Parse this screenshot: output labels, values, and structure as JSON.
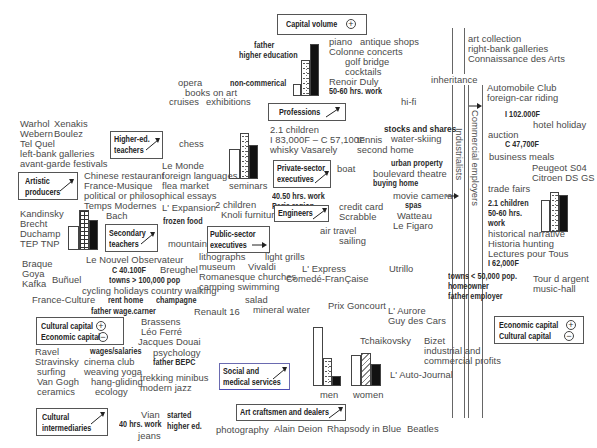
{
  "boxes": {
    "capital_volume": {
      "label": "Capital volume",
      "sign": "+"
    },
    "professions": {
      "label": "Professions"
    },
    "higher_ed_teachers": {
      "line1": "Higher-ed.",
      "line2": "teachers"
    },
    "artistic_producers": {
      "line1": "Artistic",
      "line2": "producers"
    },
    "private_sector": {
      "line1": "Private-sector",
      "line2": "executives"
    },
    "engineers": {
      "label": "Engineers"
    },
    "secondary_teachers": {
      "line1": "Secondary",
      "line2": "teachers"
    },
    "public_sector": {
      "line1": "Public-sector",
      "line2": "executives"
    },
    "cultural_capital_legend": {
      "line1": "Cultural capital",
      "line2": "Economic capital",
      "sign1": "+",
      "sign2": "−"
    },
    "economic_capital_legend": {
      "line1": "Economic capital",
      "line2": "Cultural capital",
      "sign1": "+",
      "sign2": "−"
    },
    "social_medical": {
      "line1": "Social and",
      "line2": "medical services"
    },
    "cultural_intermediaries": {
      "line1": "Cultural",
      "line2": "intermediaries"
    },
    "art_craftsmen": {
      "label": "Art craftsmen and dealers"
    }
  },
  "vertical_labels": {
    "industrialists": "Industrialists",
    "commercial_employers": "Commercial employers"
  },
  "texts": {
    "father_he_1": "father",
    "father_he_2": "higher education",
    "piano": "piano",
    "antique": "antique shops",
    "colonne": "Colonne concerts",
    "golf": "golf  bridge",
    "cocktails": "cocktails",
    "renoir": "Renoir  Duly",
    "hrs5060a": "50-60 hrs. work",
    "art_collection": "art collection",
    "rightbank": "right-bank galleries",
    "connaissance": "Connaissance des Arts",
    "inheritance": "inheritance",
    "opera": "opera",
    "books_art": "books on art",
    "cruises": "cruises",
    "exhibitions": "exhibitions",
    "noncommercial": "non-commerical",
    "hifi": "hi-fi",
    "automobile": "Automobile Club",
    "foreigncar": "foreign-car riding",
    "i102": "I 102.000F",
    "hotel": "hotel holiday",
    "auction": "auction",
    "c47": "C 47,700F",
    "business": "business meals",
    "peugeot": "Peugeot S04",
    "citroen": "Citroen DS GS",
    "trade": "trade fairs",
    "children21b": "2.1 children",
    "hrs5060b": "50-60 hrs.",
    "work_b": "work",
    "historical": "historical narrative",
    "historia": "Historia hunting",
    "lectures": "Lectures pour Tous",
    "i62": "I 62,000F",
    "towns50": "towns < 50,000 pop.",
    "homeowner": "homeowner",
    "father_employer": "father employer",
    "tour": "Tour d argent",
    "musichall": "music-hall",
    "warhol": "Warhol",
    "xenakis": "Xenakis",
    "webern": "Webern",
    "boulez": "Boulez",
    "telquel": "Tel Quel",
    "leftbank": "left-bank galleries",
    "avantgarde": "avant-garde festivals",
    "chess": "chess",
    "children21a": "2.1 children",
    "i83": "I 83,000F – C 57,100F",
    "whisky": "whisky    Vasarely",
    "stocks": "stocks and shares",
    "tennis": "tennis",
    "waterski": "water-skiing",
    "secondhome": "second home",
    "lemonde": "Le Monde",
    "foreignlang": "foreign languages",
    "flea": "flea market",
    "seminars": "seminars",
    "boat": "boat",
    "urban": "urban property",
    "boulevard": "boulevard theatre",
    "buying": "buying home",
    "chinese": "Chinese restaurant",
    "francemusique": "France-Musique",
    "political": "political or philosophical essays",
    "tempsmodernes": "Temps Modernes",
    "hrs4050": "40.50 hrs. work",
    "paris": "Paris region",
    "movie": "movie camera",
    "spas": "spas",
    "watteau": "Watteau",
    "lexpansion": "L' Expansion",
    "children2": "2 children",
    "knoli": "Knoli furniture",
    "creditcard": "credit card",
    "scrabble": "Scrabble",
    "figaro": "Le Figaro",
    "kandinsky": "Kandinsky",
    "brecht": "Brecht",
    "duchamp": "Duchamp",
    "tep": "TEP TNP",
    "bach": "Bach",
    "frozen": "frozen food",
    "airtravel": "air travel",
    "sailing": "sailing",
    "mountains": "mountains",
    "lithographs": "lithographs",
    "lightgrills": "light grills",
    "museum": "museum",
    "vivaldi": "Vivaldi",
    "romanesque": "Romanesque churches",
    "camping": "camping  swimming",
    "lexpress": "L' Express",
    "comedie": "Comedé-FranÇaise",
    "utrillo": "Utrillo",
    "braque": "Braque",
    "goya": "Goya",
    "kafka": "Kafka",
    "bunuel": "Buñuel",
    "nouvelobs": "Le Nouvel Observateur",
    "c40": "C 40.100F",
    "breughel": "Breughel",
    "towns100": "towns > 100,000 pop",
    "cycling": "cycling holidays country walking",
    "franceculture": "France-Culture",
    "renthome": "rent home",
    "champagne": "champagne",
    "salad": "salad",
    "mineral": "mineral water",
    "fatherwage": "father wage.carner",
    "renault": "Renault 16",
    "prixgoncourt": "Prix Goncourt",
    "laurore": "L' Aurore",
    "guydescars": "Guy des Cars",
    "brassens": "Brassens",
    "leoferre": "Léo Ferré",
    "jacques": "Jacques Douai",
    "ravel": "Ravel",
    "wages": "wages/salaries",
    "psychology": "psychology",
    "stravinsky": "Stravinsky",
    "cinema": "cinema club",
    "fatherbepc": "father BEPC",
    "surfing": "surfing",
    "weaving": "weaving yoga",
    "vangogh": "Van Gogh",
    "hanggliding": "hang-gliding",
    "trekking": "trekking minibus",
    "ceramics": "ceramics",
    "ecology": "ecology",
    "modernjazz": "modern jazz",
    "tchaikovsky": "Tchaikovsky",
    "bizet": "Bizet",
    "industrial": "industrial and",
    "commercialprofits": "commercial profits",
    "autojournal": "L' Auto-Journal",
    "men": "men",
    "women": "women",
    "vian": "Vian",
    "hrs40": "40 hrs. work",
    "jeans": "jeans",
    "started": "started",
    "highered": "higher ed.",
    "photography": "photography",
    "alain": "Alain Deion",
    "rhapsody": "Rhapsody in Blue",
    "beatles": "Beatles"
  }
}
